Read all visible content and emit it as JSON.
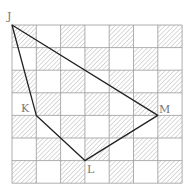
{
  "figure": {
    "grid": {
      "cols": 7,
      "rows": 7,
      "x0": 12,
      "y0": 25,
      "cell_w": 24.3,
      "cell_h": 22.6,
      "pattern": "checkerboard",
      "first_cell_hatched": true,
      "line_color": "#9a9a9a",
      "hatch_color": "#b5b5b5"
    },
    "polygon": {
      "stroke_color": "#222222",
      "vertices": [
        {
          "name": "J",
          "col": 0,
          "row": 0
        },
        {
          "name": "K",
          "col": 1,
          "row": 4
        },
        {
          "name": "L",
          "col": 3,
          "row": 6
        },
        {
          "name": "M",
          "col": 6,
          "row": 4
        }
      ]
    },
    "labels": [
      {
        "text": "J",
        "x": 7,
        "y": 20
      },
      {
        "text": "K",
        "x": 21,
        "y": 112
      },
      {
        "text": "L",
        "x": 87,
        "y": 173
      },
      {
        "text": "M",
        "x": 159,
        "y": 113
      }
    ]
  }
}
